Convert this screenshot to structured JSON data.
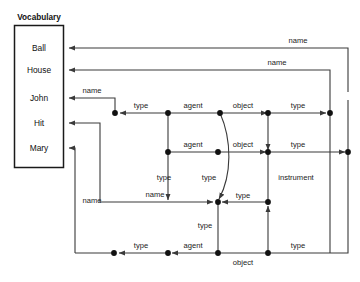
{
  "diagram": {
    "type": "semantic-network-graph",
    "vocabulary": {
      "title": "Vocabulary",
      "items": [
        "Ball",
        "House",
        "John",
        "Hit",
        "Mary"
      ]
    },
    "edge_labels": {
      "name_top": "name",
      "name_second": "name",
      "name_john": "name",
      "name_left_mary": "name",
      "name_mid": "name",
      "type_r1a": "type",
      "agent_r1": "agent",
      "object_r1": "object",
      "type_r1b": "type",
      "agent_r2": "agent",
      "object_r2": "object",
      "type_r2": "type",
      "type_v_left": "type",
      "type_v_mid": "type",
      "instrument": "instrument",
      "type_r3": "type",
      "type_v_lower": "type",
      "type_r4a": "type",
      "agent_r4": "agent",
      "object_r4": "object",
      "type_r4b": "type"
    },
    "colors": {
      "stroke": "#3a3a3a",
      "box": "#1a1a1a",
      "node": "#111111",
      "background": "#ffffff"
    }
  }
}
